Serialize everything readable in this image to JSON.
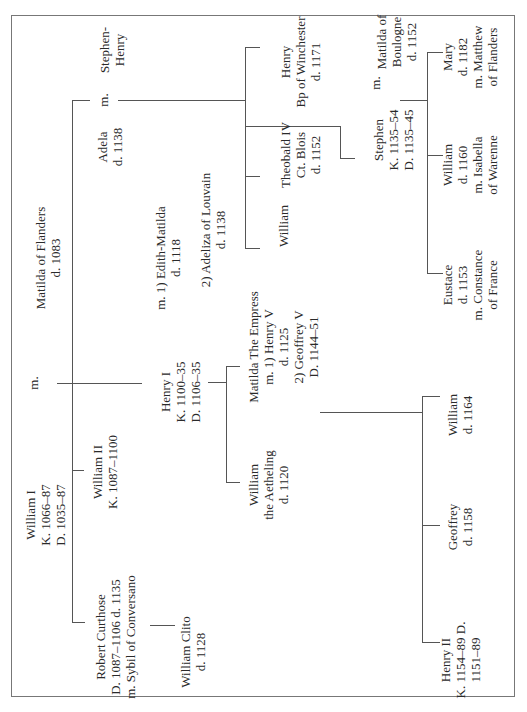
{
  "orientation": "rotated 90 degrees counter-clockwise",
  "people": {
    "william_i": {
      "lines": [
        "William I",
        "K. 1066–87",
        "D. 1035–87"
      ]
    },
    "william_i_marriage": {
      "label": "m."
    },
    "matilda_of_flanders": {
      "lines": [
        "Matilda of Flanders",
        "d. 1083"
      ]
    },
    "robert_curthose": {
      "lines": [
        "Robert Curthose",
        "D. 1087–1106 d. 1135",
        "m. Sybil of Conversano"
      ]
    },
    "william_clito": {
      "lines": [
        "William Clito",
        "d. 1128"
      ]
    },
    "william_ii": {
      "lines": [
        "William II",
        "K. 1087–1100"
      ]
    },
    "henry_i": {
      "lines": [
        "Henry I",
        "K. 1100–35",
        "D. 1106–35"
      ]
    },
    "henry_i_wife1": {
      "lines": [
        "m. 1) Edith-Matilda",
        "d. 1118"
      ]
    },
    "henry_i_wife2": {
      "lines": [
        "2) Adeliza of Louvain",
        "d. 1138"
      ]
    },
    "adela": {
      "lines": [
        "Adela",
        "d. 1138"
      ]
    },
    "adela_marriage": {
      "label": "m."
    },
    "stephen_henry": {
      "lines": [
        "Stephen-",
        "Henry"
      ]
    },
    "william_son_of_adela": {
      "lines": [
        "William"
      ]
    },
    "theobald_iv": {
      "lines": [
        "Theobald IV",
        "Ct. Blois",
        "d. 1152"
      ]
    },
    "henry_bp_winchester": {
      "lines": [
        "Henry",
        "Bp of Winchester",
        "d. 1171"
      ]
    },
    "stephen": {
      "lines": [
        "Stephen",
        "K. 1135–54",
        "D. 1135–45"
      ]
    },
    "stephen_marriage": {
      "label": "m."
    },
    "matilda_of_boulogne": {
      "lines": [
        "Matilda of",
        "Boulogne",
        "d. 1152"
      ]
    },
    "eustace": {
      "lines": [
        "Eustace",
        "d. 1153",
        "m. Constance",
        "of France"
      ]
    },
    "william_son_of_stephen": {
      "lines": [
        "William",
        "d. 1160",
        "m. Isabella",
        "of Warenne"
      ]
    },
    "mary": {
      "lines": [
        "Mary",
        "d. 1182",
        "m. Matthew",
        "of Flanders"
      ]
    },
    "matilda_the_empress": {
      "lines": [
        "Matilda The Empress",
        "m. 1) Henry V",
        "d. 1125",
        "2) Geoffrey V",
        "D. 1144–51"
      ]
    },
    "william_the_aetheling": {
      "lines": [
        "William",
        "the Aetheling",
        "d. 1120"
      ]
    },
    "henry_ii": {
      "lines": [
        "Henry II",
        "K. 1154–89 D.",
        "1151–89"
      ]
    },
    "geoffrey": {
      "lines": [
        "Geoffrey",
        "d. 1158"
      ]
    },
    "william_son_of_matilda": {
      "lines": [
        "William",
        "d. 1164"
      ]
    }
  },
  "colors": {
    "line": "#555555",
    "text": "#2a2a2a",
    "frame": "#777777",
    "background": "#ffffff"
  }
}
